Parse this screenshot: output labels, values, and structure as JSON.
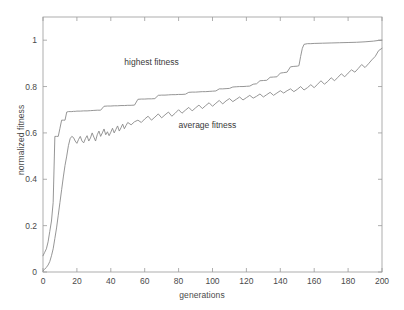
{
  "chart_data": {
    "type": "line",
    "title": "",
    "xlabel": "generations",
    "ylabel": "normalized fitness",
    "xlim": [
      0,
      200
    ],
    "ylim": [
      0,
      1.1
    ],
    "xticks": [
      0,
      20,
      40,
      60,
      80,
      100,
      120,
      140,
      160,
      180,
      200
    ],
    "yticks": [
      0,
      0.2,
      0.4,
      0.6,
      0.8,
      1
    ],
    "xticklabels": [
      "0",
      "20",
      "40",
      "60",
      "80",
      "100",
      "120",
      "140",
      "160",
      "180",
      "200"
    ],
    "yticklabels": [
      "0",
      "0.2",
      "0.4",
      "0.6",
      "0.8",
      "1"
    ],
    "grid": false,
    "legend_position": "inline-annotations",
    "line_color": "#8a8a8a",
    "axis_color": "#9a9a9a",
    "background": "#ffffff",
    "annotations": [
      {
        "text": "highest fitness",
        "x": 48,
        "y": 0.905
      },
      {
        "text": "average fitness",
        "x": 80,
        "y": 0.635
      }
    ],
    "series": [
      {
        "name": "highest fitness",
        "x": [
          0,
          1,
          2,
          3,
          4,
          5,
          6,
          7,
          8,
          9,
          10,
          11,
          12,
          13,
          14,
          15,
          16,
          17,
          18,
          19,
          20,
          22,
          24,
          26,
          28,
          30,
          32,
          34,
          36,
          38,
          40,
          42,
          44,
          46,
          48,
          50,
          52,
          54,
          56,
          58,
          60,
          62,
          64,
          66,
          68,
          70,
          72,
          74,
          76,
          78,
          80,
          82,
          84,
          86,
          88,
          90,
          92,
          94,
          96,
          98,
          100,
          102,
          104,
          106,
          108,
          110,
          112,
          114,
          116,
          118,
          120,
          122,
          124,
          126,
          128,
          130,
          132,
          134,
          136,
          138,
          140,
          142,
          144,
          146,
          148,
          150,
          151,
          152,
          153,
          154,
          156,
          158,
          160,
          165,
          170,
          175,
          180,
          185,
          190,
          195,
          198,
          200
        ],
        "values": [
          0.07,
          0.085,
          0.1,
          0.13,
          0.175,
          0.22,
          0.3,
          0.585,
          0.585,
          0.585,
          0.62,
          0.655,
          0.655,
          0.655,
          0.69,
          0.692,
          0.692,
          0.692,
          0.693,
          0.693,
          0.694,
          0.694,
          0.695,
          0.695,
          0.696,
          0.697,
          0.698,
          0.698,
          0.715,
          0.716,
          0.716,
          0.717,
          0.717,
          0.718,
          0.718,
          0.719,
          0.719,
          0.72,
          0.745,
          0.746,
          0.746,
          0.747,
          0.747,
          0.748,
          0.762,
          0.763,
          0.763,
          0.764,
          0.765,
          0.765,
          0.766,
          0.766,
          0.767,
          0.775,
          0.776,
          0.776,
          0.777,
          0.778,
          0.778,
          0.779,
          0.78,
          0.781,
          0.79,
          0.79,
          0.791,
          0.792,
          0.798,
          0.799,
          0.8,
          0.8,
          0.801,
          0.802,
          0.81,
          0.812,
          0.825,
          0.826,
          0.827,
          0.84,
          0.841,
          0.842,
          0.858,
          0.86,
          0.862,
          0.885,
          0.887,
          0.888,
          0.89,
          0.93,
          0.965,
          0.982,
          0.985,
          0.985,
          0.986,
          0.987,
          0.988,
          0.989,
          0.99,
          0.991,
          0.993,
          0.996,
          0.999,
          1.0
        ]
      },
      {
        "name": "average fitness",
        "x": [
          0,
          1,
          2,
          3,
          4,
          5,
          6,
          7,
          8,
          9,
          10,
          11,
          12,
          13,
          14,
          15,
          16,
          17,
          18,
          19,
          20,
          21,
          22,
          23,
          24,
          25,
          26,
          27,
          28,
          29,
          30,
          31,
          32,
          33,
          34,
          35,
          36,
          37,
          38,
          39,
          40,
          41,
          42,
          43,
          44,
          45,
          46,
          47,
          48,
          49,
          50,
          52,
          54,
          56,
          58,
          60,
          62,
          64,
          66,
          68,
          70,
          72,
          74,
          76,
          78,
          80,
          82,
          84,
          86,
          88,
          90,
          92,
          94,
          96,
          98,
          100,
          102,
          104,
          106,
          108,
          110,
          112,
          114,
          116,
          118,
          120,
          122,
          124,
          126,
          128,
          130,
          132,
          134,
          136,
          138,
          140,
          142,
          144,
          146,
          148,
          150,
          152,
          154,
          156,
          158,
          160,
          162,
          164,
          166,
          168,
          170,
          172,
          174,
          176,
          178,
          180,
          182,
          184,
          186,
          188,
          190,
          192,
          194,
          196,
          198,
          200
        ],
        "values": [
          0.005,
          0.012,
          0.02,
          0.03,
          0.045,
          0.07,
          0.1,
          0.145,
          0.19,
          0.245,
          0.3,
          0.355,
          0.41,
          0.46,
          0.5,
          0.545,
          0.575,
          0.585,
          0.58,
          0.565,
          0.555,
          0.572,
          0.585,
          0.565,
          0.557,
          0.575,
          0.588,
          0.565,
          0.578,
          0.6,
          0.582,
          0.565,
          0.592,
          0.608,
          0.585,
          0.6,
          0.617,
          0.592,
          0.605,
          0.588,
          0.603,
          0.62,
          0.6,
          0.615,
          0.63,
          0.608,
          0.622,
          0.638,
          0.618,
          0.632,
          0.645,
          0.635,
          0.648,
          0.655,
          0.645,
          0.66,
          0.672,
          0.655,
          0.668,
          0.682,
          0.665,
          0.678,
          0.69,
          0.672,
          0.685,
          0.7,
          0.685,
          0.698,
          0.71,
          0.695,
          0.708,
          0.72,
          0.705,
          0.718,
          0.73,
          0.715,
          0.728,
          0.74,
          0.725,
          0.738,
          0.748,
          0.735,
          0.745,
          0.755,
          0.742,
          0.752,
          0.762,
          0.75,
          0.758,
          0.768,
          0.755,
          0.765,
          0.775,
          0.762,
          0.772,
          0.782,
          0.772,
          0.782,
          0.79,
          0.778,
          0.788,
          0.8,
          0.785,
          0.795,
          0.808,
          0.795,
          0.81,
          0.825,
          0.81,
          0.822,
          0.838,
          0.825,
          0.84,
          0.855,
          0.842,
          0.858,
          0.872,
          0.862,
          0.878,
          0.895,
          0.882,
          0.898,
          0.915,
          0.93,
          0.955,
          0.965
        ]
      }
    ]
  }
}
